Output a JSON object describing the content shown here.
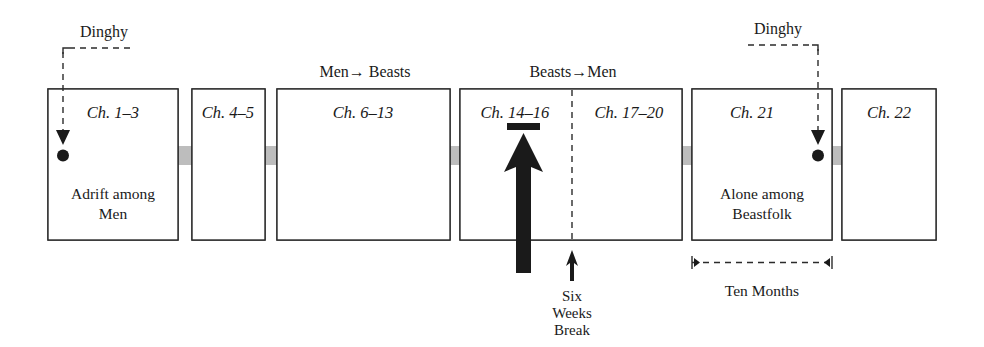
{
  "diagram": {
    "colors": {
      "band_gray": "#bdbdbd",
      "ink": "#1a1a1a",
      "box_stroke": "#2b2b2b",
      "page_background": "#ffffff"
    },
    "chapter_boxes": [
      {
        "id": "box-1",
        "label": "Ch. 1–3"
      },
      {
        "id": "box-2",
        "label": "Ch. 4–5"
      },
      {
        "id": "box-3",
        "label": "Ch. 6–13"
      },
      {
        "id": "box-4a",
        "label": "Ch. 14–16"
      },
      {
        "id": "box-4b",
        "label": "Ch. 17–20"
      },
      {
        "id": "box-5",
        "label": "Ch. 21"
      },
      {
        "id": "box-6",
        "label": "Ch. 22"
      }
    ],
    "top_labels": [
      {
        "id": "dinghy-left",
        "text": "Dinghy"
      },
      {
        "id": "men-to-beasts",
        "text": "Men→ Beasts"
      },
      {
        "id": "beasts-to-men",
        "text": "Beasts→Men"
      },
      {
        "id": "dinghy-right",
        "text": "Dinghy"
      }
    ],
    "box_captions": [
      {
        "id": "caption-adrift",
        "line1": "Adrift among",
        "line2": "Men"
      },
      {
        "id": "caption-alone",
        "line1": "Alone among",
        "line2": "Beastfolk"
      }
    ],
    "bottom_annotations": [
      {
        "id": "six-weeks-break",
        "line1": "Six",
        "line2": "Weeks",
        "line3": "Break"
      },
      {
        "id": "ten-months",
        "text": "Ten Months"
      }
    ],
    "markers": {
      "dinghy_left_marker": "down-arrow-with-dot",
      "dinghy_right_marker": "down-arrow-with-dot",
      "narrative_shift_marker": "up-arrow-black",
      "break_marker": "up-arrow-small",
      "flow_direction": "left-to-right"
    }
  }
}
